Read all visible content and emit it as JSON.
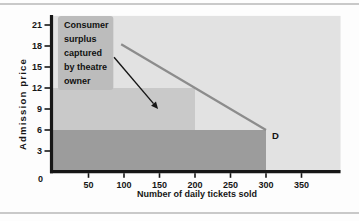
{
  "frame": {
    "background": "#fdfdfd",
    "rule_color": "#c9c9c9"
  },
  "chart_data": {
    "type": "area",
    "title": "",
    "xlabel": "Number of daily tickets sold",
    "ylabel": "Admission price",
    "x_ticks": [
      0,
      50,
      100,
      150,
      200,
      250,
      300,
      350
    ],
    "y_ticks": [
      0,
      3,
      6,
      9,
      12,
      15,
      18,
      21
    ],
    "xlim": [
      0,
      405
    ],
    "ylim": [
      0,
      22.3
    ],
    "grid": false,
    "plot_bg": "#e2e2e2",
    "axis_color": "#161616",
    "demand_curve": {
      "label": "D",
      "color": "#8c8c8c",
      "points": [
        {
          "x": 96,
          "y": 18.24
        },
        {
          "x": 300,
          "y": 6
        }
      ]
    },
    "price_blocks": [
      {
        "name": "quantity-0-300-price-0-6",
        "x0": 0,
        "x1": 300,
        "price0": 0,
        "price1": 6,
        "color": "#9c9c9c"
      },
      {
        "name": "quantity-0-200-price-6-12",
        "x0": 0,
        "x1": 200,
        "price0": 6,
        "price1": 12,
        "color": "#c9c9c9"
      }
    ],
    "annotation": {
      "text": "Consumer surplus captured by theatre owner",
      "lines": [
        "Consumer",
        "surplus",
        "captured",
        "by theatre",
        "owner"
      ],
      "box_color": "#bcbcbc",
      "box": {
        "x0": 7,
        "x1": 85,
        "price0": 11.7,
        "price1": 22.3
      },
      "arrow": {
        "from": {
          "x": 86,
          "y": 16.4
        },
        "to": {
          "x": 148,
          "y": 9
        }
      }
    }
  }
}
